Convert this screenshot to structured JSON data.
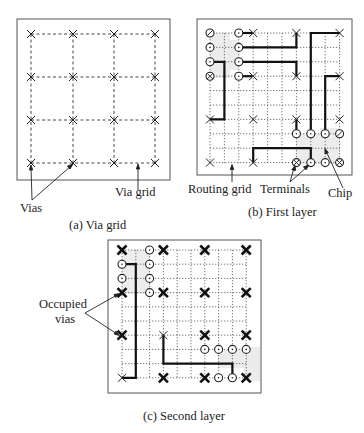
{
  "figure": {
    "panels": [
      {
        "id": "a",
        "caption": "(a)   Via grid",
        "labels": {
          "vias": "Vias",
          "via_grid": "Via grid"
        },
        "grid": {
          "cols": 4,
          "rows": 4,
          "style": "dashed"
        },
        "vias": "all 16 grid intersections marked with x"
      },
      {
        "id": "b",
        "caption": "(b)   First  layer",
        "labels": {
          "routing_grid": "Routing grid",
          "terminals": "Terminals",
          "chip": "Chip"
        },
        "grid": {
          "cols": 10,
          "rows": 10,
          "style": "dotted"
        }
      },
      {
        "id": "c",
        "caption": "(c)      Second layer",
        "labels": {
          "occupied_vias_line1": "Occupied",
          "occupied_vias_line2": "vias"
        },
        "grid": {
          "cols": 10,
          "rows": 10,
          "style": "dotted"
        }
      }
    ]
  },
  "colors": {
    "line": "#222222",
    "grid": "#555555",
    "chip_shade": "#ececec",
    "border": "#555555"
  }
}
